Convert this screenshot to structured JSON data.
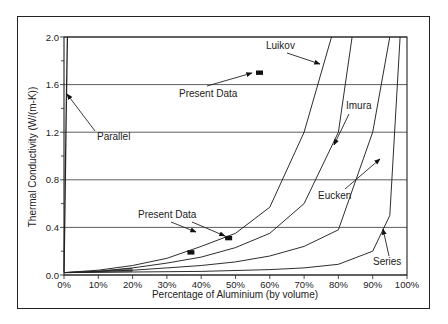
{
  "chart_data": {
    "type": "line",
    "title": "",
    "xlabel": "Percentage of Aluminium (by volume)",
    "ylabel": "Thermal Conductivity (W/(m-K))",
    "xlim": [
      0,
      100
    ],
    "ylim": [
      0,
      2.0
    ],
    "x_ticks": [
      "0%",
      "10%",
      "20%",
      "30%",
      "40%",
      "50%",
      "60%",
      "70%",
      "80%",
      "90%",
      "100%"
    ],
    "y_ticks": [
      "0.0",
      "0.4",
      "0.8",
      "1.2",
      "1.6",
      "2.0"
    ],
    "grid": "horizontal",
    "legend": "none (curves annotated with arrows)",
    "series": [
      {
        "name": "Parallel",
        "x": [
          0,
          0.3,
          0.6,
          1.0
        ],
        "y": [
          0.02,
          0.6,
          1.3,
          2.0
        ]
      },
      {
        "name": "Luikov",
        "x": [
          0,
          10,
          20,
          30,
          40,
          50,
          60,
          70,
          78
        ],
        "y": [
          0.02,
          0.04,
          0.08,
          0.14,
          0.24,
          0.35,
          0.57,
          1.2,
          2.0
        ]
      },
      {
        "name": "Imura",
        "x": [
          0,
          10,
          20,
          30,
          40,
          50,
          60,
          70,
          80,
          84
        ],
        "y": [
          0.02,
          0.03,
          0.06,
          0.1,
          0.15,
          0.23,
          0.35,
          0.6,
          1.2,
          2.0
        ]
      },
      {
        "name": "Eucken",
        "x": [
          0,
          10,
          20,
          30,
          40,
          50,
          60,
          70,
          80,
          90,
          95
        ],
        "y": [
          0.02,
          0.03,
          0.04,
          0.06,
          0.08,
          0.11,
          0.16,
          0.24,
          0.38,
          1.2,
          2.0
        ]
      },
      {
        "name": "Series",
        "x": [
          0,
          20,
          40,
          60,
          70,
          80,
          90,
          95,
          98
        ],
        "y": [
          0.02,
          0.025,
          0.03,
          0.045,
          0.06,
          0.09,
          0.2,
          0.5,
          2.0
        ]
      },
      {
        "name": "Present Data",
        "type": "scatter",
        "x": [
          37,
          48,
          57
        ],
        "y": [
          0.19,
          0.31,
          1.7
        ]
      }
    ],
    "annotations": [
      "Parallel",
      "Luikov",
      "Imura",
      "Eucken",
      "Series",
      "Present Data",
      "Present Data"
    ]
  }
}
